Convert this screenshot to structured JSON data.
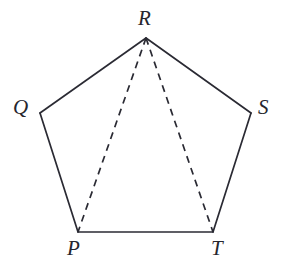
{
  "figure": {
    "background_color": "#ffffff",
    "stroke_color": "#2a2a33",
    "label_color": "#26262e",
    "width": 286,
    "height": 268
  },
  "vertices": [
    {
      "id": "R",
      "label": "R",
      "x": 146,
      "y": 38,
      "label_x": 138,
      "label_y": 8
    },
    {
      "id": "Q",
      "label": "Q",
      "x": 40,
      "y": 113,
      "label_x": 13,
      "label_y": 97
    },
    {
      "id": "S",
      "label": "S",
      "x": 251,
      "y": 113,
      "label_x": 258,
      "label_y": 97
    },
    {
      "id": "P",
      "label": "P",
      "x": 78,
      "y": 232,
      "label_x": 67,
      "label_y": 238
    },
    {
      "id": "T",
      "label": "T",
      "x": 213,
      "y": 232,
      "label_x": 211,
      "label_y": 238
    }
  ],
  "edges": [
    {
      "id": "QR",
      "from": "Q",
      "to": "R",
      "style": "solid",
      "points": "40,113 146,38"
    },
    {
      "id": "RS",
      "from": "R",
      "to": "S",
      "style": "solid",
      "points": "146,38 251,113"
    },
    {
      "id": "QP",
      "from": "Q",
      "to": "P",
      "style": "solid",
      "points": "40,113 78,232"
    },
    {
      "id": "ST",
      "from": "S",
      "to": "T",
      "style": "solid",
      "points": "251,113 213,232"
    },
    {
      "id": "PT",
      "from": "P",
      "to": "T",
      "style": "solid",
      "points": "78,232 213,232"
    },
    {
      "id": "RP",
      "from": "R",
      "to": "P",
      "style": "dashed",
      "points": "146,38 78,232"
    },
    {
      "id": "RT",
      "from": "R",
      "to": "T",
      "style": "dashed",
      "points": "146,38 213,232"
    }
  ]
}
